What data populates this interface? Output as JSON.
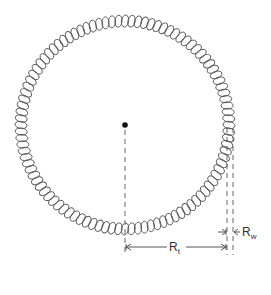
{
  "diagram": {
    "center": {
      "x": 125,
      "y": 125
    },
    "torus_radius_px": 104,
    "wire_half_width_px": 6,
    "coil_count": 100,
    "line_color": "#444444",
    "labels": {
      "rt": {
        "main": "R",
        "sub": "t"
      },
      "rw": {
        "main": "R",
        "sub": "w"
      }
    }
  }
}
